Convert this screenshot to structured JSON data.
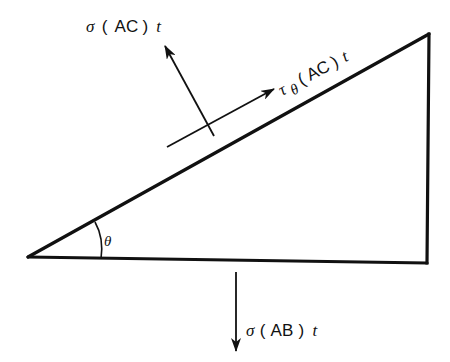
{
  "diagram": {
    "type": "free-body stress element (triangular wedge)",
    "colors": {
      "line": "#111111",
      "background": "#ffffff"
    },
    "vertices": {
      "A": {
        "x": 28,
        "y": 257
      },
      "B": {
        "x": 427,
        "y": 263
      },
      "C": {
        "x": 429,
        "y": 34
      }
    },
    "angle": {
      "symbol": "θ",
      "label": "θ"
    },
    "forces": {
      "normal_AC": {
        "sigma": "σ",
        "open": "(",
        "face": "AC",
        "close": ")",
        "thickness": "t",
        "full": "σ(AC)t"
      },
      "shear_AC": {
        "tau": "τ",
        "subscript": "θ",
        "open": "(",
        "face": "AC",
        "close": ")",
        "thickness": "t",
        "full": "τθ(AC)t"
      },
      "normal_AB": {
        "sigma": "σ",
        "open": "(",
        "face": "AB",
        "close": ")",
        "thickness": "t",
        "full": "σ(AB)t"
      }
    }
  }
}
